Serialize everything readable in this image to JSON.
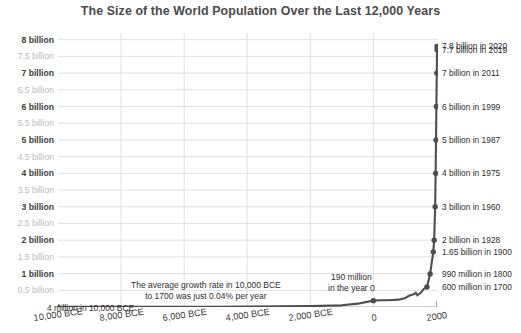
{
  "chart_data": {
    "type": "line",
    "title": "The Size of the World Population Over the Last 12,000 Years",
    "xlabel": "",
    "ylabel": "",
    "xlim": [
      -10000,
      2050
    ],
    "ylim": [
      0,
      8200000000
    ],
    "grid": true,
    "legend": "none",
    "x": [
      -10000,
      -8000,
      -6000,
      -5000,
      -4000,
      -3000,
      -2000,
      -1000,
      -500,
      0,
      200,
      400,
      600,
      800,
      1000,
      1100,
      1200,
      1300,
      1340,
      1400,
      1500,
      1600,
      1700,
      1800,
      1900,
      1928,
      1960,
      1975,
      1987,
      1999,
      2011,
      2019,
      2020
    ],
    "y": [
      4000000,
      5000000,
      7000000,
      9000000,
      12000000,
      20000000,
      27000000,
      50000000,
      100000000,
      190000000,
      200000000,
      200000000,
      210000000,
      220000000,
      265000000,
      320000000,
      360000000,
      390000000,
      430000000,
      350000000,
      425000000,
      545000000,
      600000000,
      990000000,
      1650000000,
      2000000000,
      3000000000,
      4000000000,
      5000000000,
      6000000000,
      7000000000,
      7700000000,
      7800000000
    ],
    "y_axis_ticks": [
      {
        "value": 8000000000,
        "label": "8 billion",
        "major": true
      },
      {
        "value": 7500000000,
        "label": "7.5 billion",
        "major": false
      },
      {
        "value": 7000000000,
        "label": "7 billion",
        "major": true
      },
      {
        "value": 6500000000,
        "label": "6.5 billion",
        "major": false
      },
      {
        "value": 6000000000,
        "label": "6 billion",
        "major": true
      },
      {
        "value": 5500000000,
        "label": "5.5 billion",
        "major": false
      },
      {
        "value": 5000000000,
        "label": "5 billion",
        "major": true
      },
      {
        "value": 4500000000,
        "label": "4.5 billion",
        "major": false
      },
      {
        "value": 4000000000,
        "label": "4 billion",
        "major": true
      },
      {
        "value": 3500000000,
        "label": "3.5 billion",
        "major": false
      },
      {
        "value": 3000000000,
        "label": "3 billion",
        "major": true
      },
      {
        "value": 2500000000,
        "label": "2.5 billion",
        "major": false
      },
      {
        "value": 2000000000,
        "label": "2 billion",
        "major": true
      },
      {
        "value": 1500000000,
        "label": "1.5 billion",
        "major": false
      },
      {
        "value": 1000000000,
        "label": "1 billion",
        "major": true
      },
      {
        "value": 500000000,
        "label": "0.5 billion",
        "major": false
      }
    ],
    "x_axis_ticks": [
      {
        "value": -10000,
        "label": "10,000 BCE"
      },
      {
        "value": -8000,
        "label": "8,000 BCE"
      },
      {
        "value": -6000,
        "label": "6,000 BCE"
      },
      {
        "value": -4000,
        "label": "4,000 BCE"
      },
      {
        "value": -2000,
        "label": "2,000 BCE"
      },
      {
        "value": 0,
        "label": "0"
      },
      {
        "value": 2000,
        "label": "2000"
      }
    ],
    "markers": [
      {
        "x": -10000,
        "y": 4000000,
        "label": ""
      },
      {
        "x": 0,
        "y": 190000000,
        "label": ""
      },
      {
        "x": 1700,
        "y": 600000000,
        "label": "600 million in 1700"
      },
      {
        "x": 1800,
        "y": 990000000,
        "label": "990 million in 1800"
      },
      {
        "x": 1900,
        "y": 1650000000,
        "label": "1.65 billion in 1900"
      },
      {
        "x": 1928,
        "y": 2000000000,
        "label": "2 billion in 1928"
      },
      {
        "x": 1960,
        "y": 3000000000,
        "label": "3 billion in 1960"
      },
      {
        "x": 1975,
        "y": 4000000000,
        "label": "4 billion in 1975"
      },
      {
        "x": 1987,
        "y": 5000000000,
        "label": "5 billion in 1987"
      },
      {
        "x": 1999,
        "y": 6000000000,
        "label": "6 billion in 1999"
      },
      {
        "x": 2011,
        "y": 7000000000,
        "label": "7 billion in 2011"
      },
      {
        "x": 2019,
        "y": 7700000000,
        "label": "7.7 billion in 2019"
      },
      {
        "x": 2020,
        "y": 7800000000,
        "label": "7.8 billion in 2020"
      }
    ],
    "annotations": [
      {
        "name": "start-point",
        "text": "4 million in 10,000 BCE"
      },
      {
        "name": "growth-rate",
        "text_line1": "The average growth rate in 10,000 BCE",
        "text_line2": "to 1700 was just 0.04% per year"
      },
      {
        "name": "year-zero",
        "text_line1": "190 million",
        "text_line2": "in the year 0"
      }
    ],
    "right_labels": [
      {
        "value": 7800000000,
        "text": "7.8 billion in 2020"
      },
      {
        "value": 7700000000,
        "text": "7.7 billion in 2019"
      },
      {
        "value": 7000000000,
        "text": "7 billion in 2011"
      },
      {
        "value": 6000000000,
        "text": "6 billion in 1999"
      },
      {
        "value": 5000000000,
        "text": "5 billion in 1987"
      },
      {
        "value": 4000000000,
        "text": "4 billion in 1975"
      },
      {
        "value": 3000000000,
        "text": "3 billion in 1960"
      },
      {
        "value": 2000000000,
        "text": "2 billion in 1928"
      },
      {
        "value": 1650000000,
        "text": "1.65 billion in 1900"
      },
      {
        "value": 990000000,
        "text": "990 million in 1800"
      },
      {
        "value": 600000000,
        "text": "600 million in 1700"
      }
    ],
    "colors": {
      "line": "#4d4d4d",
      "marker": "#4d4d4d",
      "grid": "#d9d9d9",
      "axis": "#9a9a9a",
      "title_text": "#4a4a4a",
      "major_tick_text": "#3b3b3b",
      "minor_tick_text": "#bdbdbd",
      "annotation_text": "#2e2e2e",
      "background": "#ffffff"
    }
  }
}
